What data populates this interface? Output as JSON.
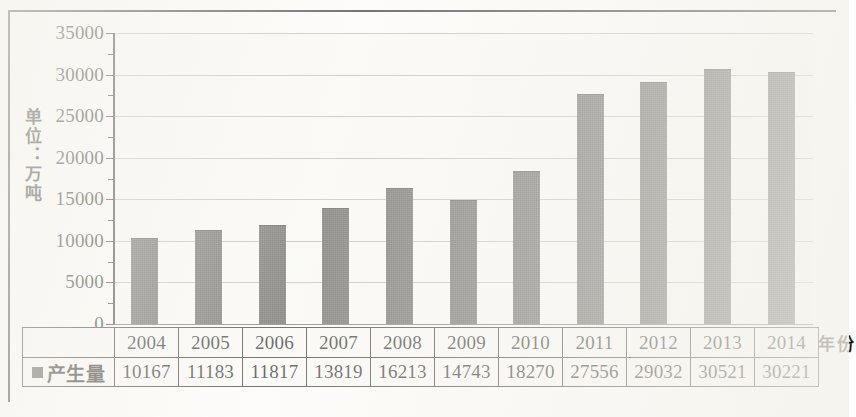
{
  "chart_data": {
    "type": "bar",
    "title": "",
    "xlabel": "年份",
    "ylabel": "单位：万吨",
    "legend": [
      {
        "name": "产生量",
        "color": "#585651",
        "marker": "square"
      }
    ],
    "legend_position": "left-of-table",
    "categories": [
      "2004",
      "2005",
      "2006",
      "2007",
      "2008",
      "2009",
      "2010",
      "2011",
      "2012",
      "2013",
      "2014"
    ],
    "series": [
      {
        "name": "产生量",
        "values": [
          10167,
          11183,
          11817,
          13819,
          16213,
          14743,
          18270,
          27556,
          29032,
          30521,
          30221
        ]
      }
    ],
    "ylim": [
      0,
      35000
    ],
    "ytick_values": [
      0,
      5000,
      10000,
      15000,
      20000,
      25000,
      30000,
      35000
    ],
    "ytick_labels": [
      "0",
      "5000",
      "10000",
      "15000",
      "20000",
      "25000",
      "30000",
      "35000"
    ],
    "grid": true,
    "grid_axis": "y",
    "has_data_table": true
  },
  "colors": {
    "bar": "#585651",
    "axis": "#2a2a28",
    "gridline": "#b9b7ae",
    "plot_background": "#f8f7f3",
    "page_background": "#fbfaf7",
    "text": "#1c1c1a"
  },
  "table": {
    "legend_label": "产生量",
    "year_row": [
      "2004",
      "2005",
      "2006",
      "2007",
      "2008",
      "2009",
      "2010",
      "2011",
      "2012",
      "2013",
      "2014"
    ],
    "value_row": [
      "10167",
      "11183",
      "11817",
      "13819",
      "16213",
      "14743",
      "18270",
      "27556",
      "29032",
      "30521",
      "30221"
    ]
  },
  "axes": {
    "y_title": "单位：万吨",
    "x_title": "年份"
  }
}
